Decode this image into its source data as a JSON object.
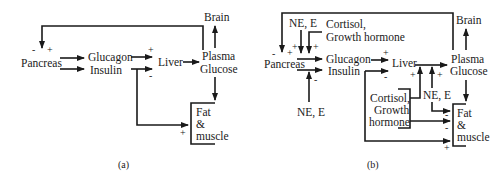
{
  "panels": [
    {
      "id": "a",
      "caption": "(a)",
      "nodes": {
        "pancreas": "Pancreas",
        "glucagon": "Glucagon",
        "insulin": "Insulin",
        "liver": "Liver",
        "plasma": "Plasma",
        "glucose": "Glucose",
        "brain": "Brain",
        "fat": "Fat",
        "amp": "&",
        "muscle": "muscle"
      },
      "signs": {
        "pancreas_feedback_minus": "-",
        "pancreas_feedback_plus": "+",
        "glucagon_to_liver": "+",
        "insulin_to_liver": "-",
        "insulin_to_fat_muscle": "+"
      }
    },
    {
      "id": "b",
      "caption": "(b)",
      "nodes": {
        "ne_e_top": "NE, E",
        "cortisol_top_1": "Cortisol,",
        "cortisol_top_2": "Growth hormone",
        "pancreas": "Pancreas",
        "glucagon": "Glucagon",
        "insulin": "Insulin",
        "ne_e_bottom": "NE, E",
        "liver": "Liver",
        "plasma": "Plasma",
        "glucose": "Glucose",
        "brain": "Brain",
        "cortisol_mid_1": "Cortisol,",
        "cortisol_mid_2": "Growth",
        "cortisol_mid_3": "hormone",
        "ne_e_right": "NE, E",
        "fat": "Fat",
        "amp": "&",
        "muscle": "muscle"
      },
      "signs": {
        "pancreas_feedback_minus": "-",
        "pancreas_feedback_plus": "+",
        "ne_e_to_glucagon": "+",
        "cortisol_to_glucagon": "+",
        "ne_e_to_insulin": "-",
        "glucagon_to_liver": "+",
        "insulin_to_liver": "-",
        "cortisol_to_liver": "+",
        "ne_e_to_liver": "+",
        "ne_e_to_fat_muscle": "-",
        "cortisol_to_fat_muscle": "-",
        "insulin_to_fat_muscle": "+"
      }
    }
  ]
}
